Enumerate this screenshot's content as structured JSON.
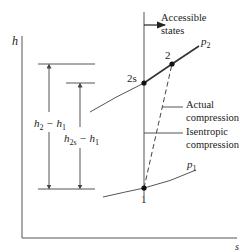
{
  "diagram": {
    "axes": {
      "y_label": "h",
      "x_label": "s"
    },
    "points": {
      "p1_state": "1",
      "p2_state": "2",
      "p2s_state": "2s"
    },
    "curves": {
      "p2_label_main": "p",
      "p2_label_sub": "2",
      "p1_label_main": "p",
      "p1_label_sub": "1"
    },
    "annotations": {
      "accessible_line1": "Accessible",
      "accessible_line2": "states",
      "actual_line1": "Actual",
      "actual_line2": "compression",
      "isentropic_line1": "Isentropic",
      "isentropic_line2": "compression"
    },
    "dimensions": {
      "actual_main": "h",
      "actual_sub1": "2",
      "actual_mid": " − h",
      "actual_sub2": "1",
      "isen_main": "h",
      "isen_sub1": "2s",
      "isen_mid": " − h",
      "isen_sub2": "1"
    },
    "colors": {
      "line": "#555555",
      "point": "#111111",
      "text": "#222222"
    }
  }
}
